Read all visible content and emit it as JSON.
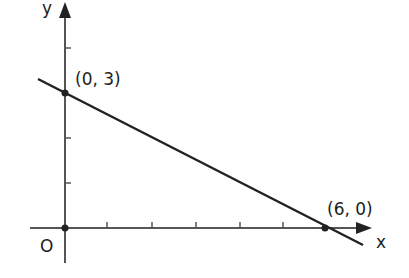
{
  "diagram": {
    "type": "coordinate-plane-line",
    "axes": {
      "x_label": "x",
      "y_label": "y",
      "origin_label": "O"
    },
    "line": {
      "description": "straight line through two intercepts",
      "slope": -0.5,
      "y_intercept": 3,
      "x_intercept": 6
    },
    "points": [
      {
        "label": "(0, 3)",
        "x": 0,
        "y": 3
      },
      {
        "label": "(6, 0)",
        "x": 6,
        "y": 0
      }
    ],
    "ticks": {
      "x": [
        1,
        2,
        3,
        4,
        5
      ],
      "y": [
        1,
        2,
        3,
        4
      ]
    },
    "colors": {
      "axis": "#555555",
      "line": "#222222",
      "text": "#222222"
    }
  }
}
